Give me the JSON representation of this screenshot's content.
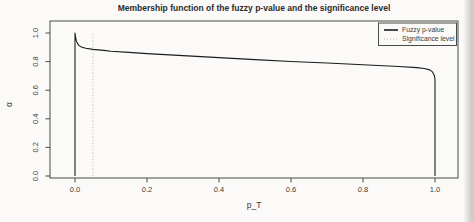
{
  "title": "Membership function of the fuzzy p-value and the significance level",
  "chart_data": {
    "type": "line",
    "title": "Membership function of the fuzzy p-value and the significance level",
    "xlabel": "p_T",
    "ylabel": "α",
    "xlim": [
      0,
      1
    ],
    "ylim": [
      0,
      1
    ],
    "grid": false,
    "x_tick_labels": [
      "0.0",
      "0.2",
      "0.4",
      "0.6",
      "0.8",
      "1.0"
    ],
    "y_tick_labels": [
      "0.0",
      "0.2",
      "0.4",
      "0.6",
      "0.8",
      "1.0"
    ],
    "significance_level": 0.05,
    "colors": {
      "curve": "#1c1c1c",
      "significance_line": "#b3b3ae",
      "frame": "#4a4a46"
    },
    "legend": {
      "position": "top-right",
      "entries": [
        {
          "label": "Fuzzy p-value",
          "line_style": "solid",
          "color": "#1c1c1c"
        },
        {
          "label": "Significance level",
          "line_style": "dotted",
          "color": "#b3b3ae"
        }
      ]
    },
    "series": [
      {
        "name": "Fuzzy p-value",
        "points": [
          [
            0,
            0
          ],
          [
            0,
            1
          ],
          [
            0.002,
            0.965
          ],
          [
            0.004,
            0.945
          ],
          [
            0.007,
            0.927
          ],
          [
            0.01,
            0.915
          ],
          [
            0.015,
            0.906
          ],
          [
            0.02,
            0.9
          ],
          [
            0.03,
            0.893
          ],
          [
            0.05,
            0.885
          ],
          [
            0.08,
            0.878
          ],
          [
            0.1,
            0.873
          ],
          [
            0.15,
            0.864
          ],
          [
            0.2,
            0.856
          ],
          [
            0.3,
            0.842
          ],
          [
            0.4,
            0.828
          ],
          [
            0.5,
            0.814
          ],
          [
            0.6,
            0.801
          ],
          [
            0.7,
            0.79
          ],
          [
            0.8,
            0.778
          ],
          [
            0.9,
            0.766
          ],
          [
            0.95,
            0.758
          ],
          [
            0.97,
            0.752
          ],
          [
            0.985,
            0.742
          ],
          [
            0.993,
            0.728
          ],
          [
            0.997,
            0.71
          ],
          [
            0.999,
            0.695
          ],
          [
            1,
            0.675
          ],
          [
            1,
            0
          ]
        ]
      }
    ]
  }
}
